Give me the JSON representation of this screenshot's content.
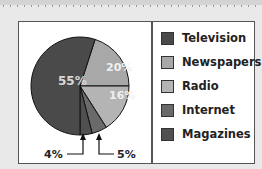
{
  "chart_data": {
    "type": "pie",
    "title": "",
    "categories": [
      "Television",
      "Newspapers",
      "Radio",
      "Internet",
      "Magazines"
    ],
    "values": [
      55,
      20,
      16,
      5,
      4
    ],
    "labels": [
      "55%",
      "20%",
      "16%",
      "5%",
      "4%"
    ],
    "colors": [
      "#4a4a4a",
      "#a8a8a8",
      "#b4b4b4",
      "#6a6a6a",
      "#505050"
    ],
    "legend_position": "right",
    "annotations": [
      {
        "text": "4%",
        "target": "Magazines",
        "style": "arrow-callout"
      },
      {
        "text": "5%",
        "target": "Internet",
        "style": "arrow-callout"
      }
    ]
  },
  "legend": {
    "items": [
      {
        "label": "Television",
        "color": "#4a4a4a"
      },
      {
        "label": "Newspapers",
        "color": "#a8a8a8"
      },
      {
        "label": "Radio",
        "color": "#b4b4b4"
      },
      {
        "label": "Internet",
        "color": "#6a6a6a"
      },
      {
        "label": "Magazines",
        "color": "#505050"
      }
    ]
  }
}
